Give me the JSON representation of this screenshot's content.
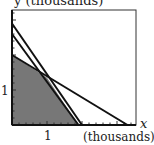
{
  "chart_data": {
    "type": "line",
    "title": "",
    "xlabel": "x",
    "xlabel_unit": "(thousands)",
    "ylabel": "y (thousands)",
    "xlim": [
      0,
      3.6
    ],
    "ylim": [
      0,
      3.3
    ],
    "x_tick_labels": [
      {
        "value": 1,
        "label": "1"
      }
    ],
    "y_tick_labels": [
      {
        "value": 1,
        "label": "1"
      }
    ],
    "minor_tick_step": 0.2,
    "grid": false,
    "legend": null,
    "series": [
      {
        "name": "constraint-line-1",
        "points": [
          [
            0,
            2.9
          ],
          [
            2.0,
            0
          ]
        ]
      },
      {
        "name": "constraint-line-2",
        "points": [
          [
            0,
            2.6
          ],
          [
            1.9,
            0
          ]
        ]
      },
      {
        "name": "constraint-line-3",
        "points": [
          [
            0,
            2.0
          ],
          [
            3.3,
            0
          ]
        ]
      }
    ],
    "feasible_region": {
      "shaded": true,
      "color": "#777777",
      "vertices": [
        [
          0,
          0
        ],
        [
          0,
          2.0
        ],
        [
          1.0,
          1.35
        ],
        [
          1.9,
          0
        ]
      ]
    }
  },
  "labels": {
    "y_axis": "y (thousands)",
    "x_axis": "x",
    "x_unit": "(thousands)",
    "x_tick": "1",
    "y_tick": "1"
  }
}
